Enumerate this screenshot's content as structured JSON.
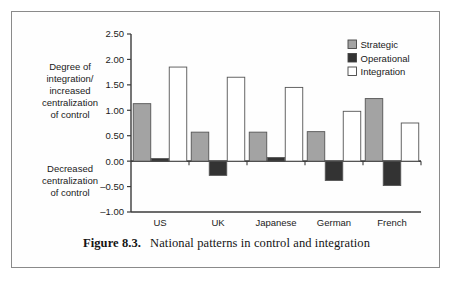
{
  "caption": {
    "figure_number": "Figure 8.3.",
    "text": "National patterns in control and integration"
  },
  "annotations": {
    "upper": [
      "Degree of",
      "integration/",
      "increased",
      "centralization",
      "of control"
    ],
    "lower": [
      "Decreased",
      "centralization",
      "of control"
    ]
  },
  "legend": {
    "items": [
      {
        "label": "Strategic",
        "color": "#a3a3a3"
      },
      {
        "label": "Operational",
        "color": "#333333"
      },
      {
        "label": "Integration",
        "color": "#ffffff"
      }
    ]
  },
  "chart_data": {
    "type": "bar",
    "title": "National patterns in control and integration",
    "xlabel": "",
    "ylabel": "",
    "ylim": [
      -1.0,
      2.5
    ],
    "ytick_step": 0.5,
    "ytick_labels": [
      "2.50",
      "2.00",
      "1.50",
      "1.00",
      "0.50",
      "0.00",
      "-0.50",
      "-1.00"
    ],
    "ytick_values": [
      2.5,
      2.0,
      1.5,
      1.0,
      0.5,
      0.0,
      -0.5,
      -1.0
    ],
    "grid": false,
    "legend_position": "top-right",
    "categories": [
      "US",
      "UK",
      "Japanese",
      "German",
      "French"
    ],
    "series": [
      {
        "name": "Strategic",
        "color": "#a3a3a3",
        "values": [
          1.13,
          0.57,
          0.57,
          0.58,
          1.23
        ]
      },
      {
        "name": "Operational",
        "color": "#333333",
        "values": [
          0.05,
          -0.28,
          0.07,
          -0.38,
          -0.48
        ]
      },
      {
        "name": "Integration",
        "color": "#ffffff",
        "values": [
          1.85,
          1.65,
          1.45,
          0.98,
          0.75
        ]
      }
    ]
  }
}
